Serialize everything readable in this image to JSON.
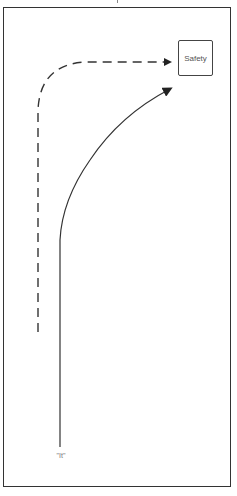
{
  "diagram": {
    "nodes": {
      "target": {
        "label": "Safety"
      },
      "origin": {
        "label": "\"It\""
      }
    },
    "edges": [
      {
        "name": "dashed-path",
        "style": "dashed",
        "from": "left-side",
        "to": "Safety"
      },
      {
        "name": "solid-path",
        "style": "solid",
        "from": "\"It\"",
        "to": "below Safety"
      }
    ],
    "colors": {
      "line": "#333333",
      "text": "#555555",
      "background": "#ffffff"
    }
  }
}
